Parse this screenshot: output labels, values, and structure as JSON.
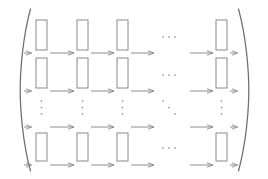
{
  "figure": {
    "kind": "commutative-grid-diagram",
    "canvas": {
      "width": 268,
      "height": 179
    },
    "stroke_color": "#8a8a8a",
    "stroke_color_dark": "#6f6f6f",
    "background_color": "#ffffff",
    "stroke_width": 1,
    "delimiters": {
      "left": {
        "glyph": "(",
        "name": "left-paren",
        "x": 22,
        "top": 8,
        "bottom": 172
      },
      "right": {
        "glyph": ")",
        "name": "right-paren",
        "x": 246,
        "top": 8,
        "bottom": 172
      }
    },
    "grid": {
      "rect_columns_x": [
        36,
        77,
        117,
        216
      ],
      "ellipsis_column_x": 168,
      "rect_rows_y": [
        20,
        63,
        106,
        136
      ],
      "arrow_rows_y": [
        52,
        95,
        127,
        165
      ],
      "rect_width": 11,
      "rect_height": 30,
      "rect_height_short": 26
    },
    "ellipsis": {
      "horizontal": "⋯",
      "vertical": "⋮",
      "diagonal": "⋱"
    },
    "arrows": {
      "stub_left_label": "↦",
      "long_label": "⟶",
      "stub_right_label": "↦",
      "head_length": 4,
      "head_half_width": 2.4
    },
    "counts": {
      "rect_columns": 4,
      "rect_rows": 3,
      "arrow_rows": 4,
      "arrows_per_row": 6
    }
  }
}
